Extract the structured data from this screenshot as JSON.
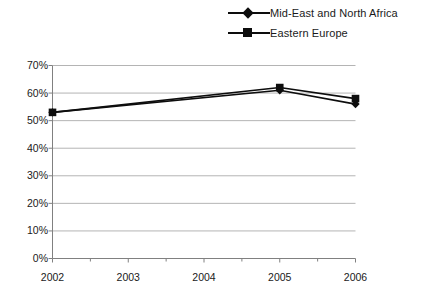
{
  "legend": {
    "position": "top-right",
    "items": [
      {
        "label": "Mid-East and North Africa",
        "marker": "diamond-marker-icon",
        "color": "#0d0d0d"
      },
      {
        "label": "Eastern Europe",
        "marker": "square-marker-icon",
        "color": "#0d0d0d"
      }
    ]
  },
  "axes": {
    "y_tick_labels": [
      "70%",
      "60%",
      "50%",
      "40%",
      "30%",
      "20%",
      "10%",
      "0%"
    ],
    "x_tick_labels": [
      "2002",
      "2003",
      "2004",
      "2005",
      "2006"
    ]
  },
  "chart_data": {
    "type": "line",
    "title": "",
    "subtitle": "",
    "xlabel": "",
    "ylabel": "",
    "categories": [
      "2002",
      "2003",
      "2004",
      "2005",
      "2006"
    ],
    "x": [
      2002,
      2003,
      2004,
      2005,
      2006
    ],
    "xlim": [
      2002,
      2006
    ],
    "ylim": [
      0,
      70
    ],
    "y_ticks": [
      0,
      10,
      20,
      30,
      40,
      50,
      60,
      70
    ],
    "y_tick_format": "percent",
    "x_minor_ticks": true,
    "grid": "horizontal",
    "legend_position": "top-right",
    "series": [
      {
        "name": "Mid-East and North Africa",
        "marker": "diamond",
        "color": "#0d0d0d",
        "values": [
          53,
          null,
          null,
          61,
          56
        ]
      },
      {
        "name": "Eastern Europe",
        "marker": "square",
        "color": "#0d0d0d",
        "values": [
          53,
          null,
          null,
          62,
          58
        ]
      }
    ]
  },
  "colors": {
    "line": "#0d0d0d",
    "grid": "#b4b4b4",
    "axis": "#808080",
    "text": "#1a1a1a",
    "background": "#ffffff"
  }
}
